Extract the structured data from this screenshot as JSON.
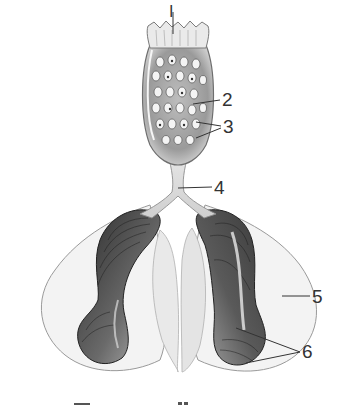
{
  "figure": {
    "type": "botanical-anatomical-illustration",
    "labels": [
      {
        "id": "1",
        "text": "I",
        "x": 171,
        "y": 8
      },
      {
        "id": "2",
        "text": "2",
        "x": 223,
        "y": 91
      },
      {
        "id": "3",
        "text": "3",
        "x": 224,
        "y": 118
      },
      {
        "id": "4",
        "text": "4",
        "x": 216,
        "y": 185
      },
      {
        "id": "5",
        "text": "5",
        "x": 314,
        "y": 289
      },
      {
        "id": "6",
        "text": "6",
        "x": 303,
        "y": 344
      }
    ],
    "colors": {
      "ink": "#333333",
      "dark_shading": "#3a3a3a",
      "mid_shading": "#8a8a8a",
      "light_fill": "#eeeeee",
      "background": "#ffffff"
    }
  }
}
